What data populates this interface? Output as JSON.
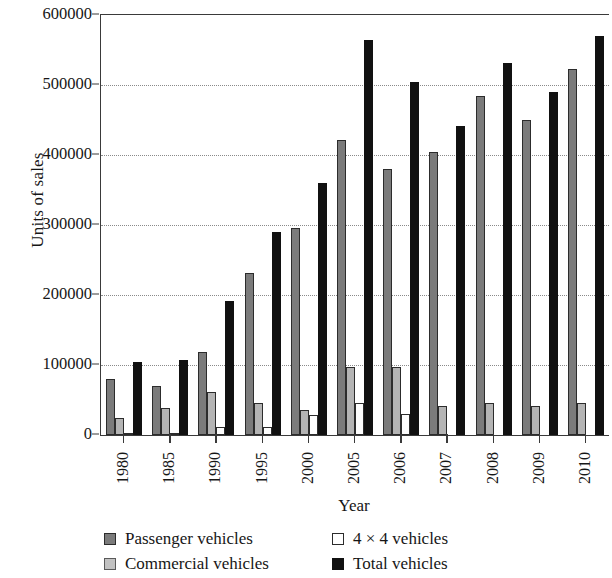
{
  "chart_data": {
    "type": "bar",
    "title": "",
    "xlabel": "Year",
    "ylabel": "Units of sales",
    "categories": [
      "1980",
      "1985",
      "1990",
      "1995",
      "2000",
      "2005",
      "2006",
      "2007",
      "2008",
      "2009",
      "2010"
    ],
    "ylim": [
      0,
      600000
    ],
    "ytick_labels": [
      "0",
      "100000",
      "200000",
      "300000",
      "400000",
      "500000",
      "600000"
    ],
    "ytick_values": [
      0,
      100000,
      200000,
      300000,
      400000,
      500000,
      600000
    ],
    "grid": "horizontal-dotted",
    "legend_position": "bottom",
    "series": [
      {
        "name": "Passenger vehicles",
        "color": "#7b7b7b",
        "values": [
          80000,
          70000,
          119000,
          231000,
          296000,
          422000,
          380000,
          404000,
          485000,
          450000,
          523000
        ]
      },
      {
        "name": "Commercial vehicles",
        "color": "#b4b4b4",
        "values": [
          25000,
          38000,
          62000,
          46000,
          36000,
          97000,
          97000,
          41000,
          46000,
          41000,
          46000
        ]
      },
      {
        "name": "4 × 4 vehicles",
        "color": "#ffffff",
        "values": [
          2000,
          2000,
          12000,
          12000,
          28000,
          46000,
          30000,
          0,
          0,
          0,
          0
        ]
      },
      {
        "name": "Total vehicles",
        "color": "#111111",
        "values": [
          105000,
          107000,
          192000,
          290000,
          360000,
          565000,
          505000,
          442000,
          531000,
          490000,
          570000
        ]
      }
    ]
  }
}
